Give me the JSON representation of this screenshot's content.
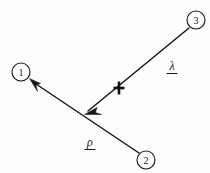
{
  "figure": {
    "background_color": "#fdfdfd",
    "ink_color": "#161616",
    "width": 210,
    "height": 173
  },
  "nodes": [
    {
      "id": "1",
      "label": "1",
      "cx": 21,
      "cy": 72,
      "r": 9
    },
    {
      "id": "2",
      "label": "2",
      "cx": 146,
      "cy": 160,
      "r": 9
    },
    {
      "id": "3",
      "label": "3",
      "cx": 196,
      "cy": 20,
      "r": 9
    }
  ],
  "vectors": [
    {
      "name": "rho",
      "label": "ρ",
      "underlined": true,
      "from_node": "2",
      "to_node": "1",
      "label_x": 90,
      "label_y": 146,
      "start": {
        "x": 139,
        "y": 153
      },
      "end": {
        "x": 30,
        "y": 80
      },
      "arrow_at": "end"
    },
    {
      "name": "lambda",
      "label": "λ",
      "underlined": true,
      "from_node": "3",
      "to_point": "rho-midpoint",
      "label_x": 172,
      "label_y": 70,
      "start": {
        "x": 189,
        "y": 28
      },
      "end": {
        "x": 86,
        "y": 113
      },
      "arrow_at": "end"
    }
  ],
  "marks": [
    {
      "name": "cross-mark",
      "glyph": "✕",
      "x": 119,
      "y": 88,
      "size": 11,
      "on_vector": "lambda"
    }
  ]
}
